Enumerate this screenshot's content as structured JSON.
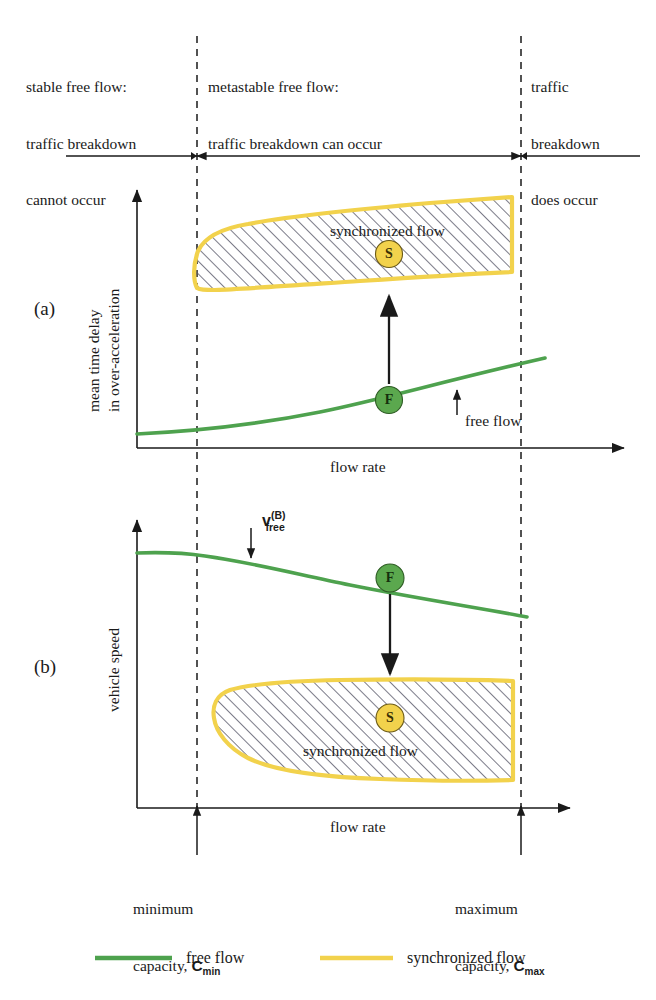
{
  "figure": {
    "colors": {
      "free_flow_green": "#4EA24E",
      "synchronized_yellow": "#F2D24C",
      "axis_black": "#1a1a1a",
      "hatch_gray": "#5a5a6a",
      "background": "#ffffff"
    }
  },
  "regimes": [
    {
      "id": "stable",
      "lines": [
        "stable free flow:",
        "traffic breakdown",
        "cannot occur"
      ]
    },
    {
      "id": "metastable",
      "lines": [
        "metastable free flow:",
        "traffic breakdown can occur"
      ]
    },
    {
      "id": "breakdown",
      "lines": [
        "traffic",
        "breakdown",
        "does occur"
      ]
    }
  ],
  "panels": [
    {
      "id": "a",
      "letter": "(a)",
      "ylabel_lines": [
        "mean time delay",
        "in over-acceleration"
      ],
      "xlabel": "flow rate",
      "free_flow_marker": "F",
      "sync_marker": "S",
      "region_label": "synchronized flow",
      "curve_label": "free flow",
      "arrow_direction": "up"
    },
    {
      "id": "b",
      "letter": "(b)",
      "ylabel_lines": [
        "vehicle speed"
      ],
      "xlabel": "flow rate",
      "free_flow_marker": "F",
      "sync_marker": "S",
      "region_label": "synchronized flow",
      "speed_annotation": {
        "base": "v",
        "sub": "free",
        "sup": "(B)"
      },
      "arrow_direction": "down"
    }
  ],
  "capacities": [
    {
      "id": "min",
      "line1": "minimum",
      "line2_prefix": "capacity, ",
      "symbol_base": "C",
      "symbol_sub": "min"
    },
    {
      "id": "max",
      "line1": "maximum",
      "line2_prefix": "capacity, ",
      "symbol_base": "C",
      "symbol_sub": "max"
    }
  ],
  "legend": {
    "items": [
      {
        "id": "free-flow",
        "label": "free flow",
        "color": "#4EA24E"
      },
      {
        "id": "synchronized-flow",
        "label": "synchronized flow",
        "color": "#F2D24C"
      }
    ]
  },
  "chart_data": {
    "type": "line",
    "xlabel": "flow rate",
    "grid": false,
    "legend_position": "bottom",
    "vertical_markers": [
      {
        "label": "minimum capacity, Cmin",
        "x_px": 197
      },
      {
        "label": "maximum capacity, Cmax",
        "x_px": 521
      }
    ],
    "panels": [
      {
        "id": "a",
        "ylabel": "mean time delay in over-acceleration",
        "series": [
          {
            "name": "free flow",
            "type": "line",
            "color": "#4EA24E",
            "points_px": [
              [
                137,
                434
              ],
              [
                200,
                429
              ],
              [
                260,
                422
              ],
              [
                320,
                411
              ],
              [
                380,
                396
              ],
              [
                440,
                381
              ],
              [
                500,
                368
              ],
              [
                545,
                359
              ]
            ]
          },
          {
            "name": "synchronized flow",
            "type": "region",
            "color": "#F2D24C",
            "hatched": true,
            "outline_px": [
              [
                198,
                279
              ],
              [
                203,
                254
              ],
              [
                218,
                237
              ],
              [
                245,
                227
              ],
              [
                300,
                219
              ],
              [
                380,
                211
              ],
              [
                450,
                203
              ],
              [
                510,
                198
              ],
              [
                510,
                272
              ],
              [
                440,
                276
              ],
              [
                360,
                281
              ],
              [
                280,
                285
              ],
              [
                230,
                288
              ],
              [
                205,
                288
              ],
              [
                198,
                284
              ]
            ]
          }
        ],
        "annotations": [
          {
            "text": "synchronized flow",
            "x_px": 330,
            "y_px": 232
          },
          {
            "text": "S",
            "x_px": 389,
            "y_px": 254,
            "marker": "circle-yellow"
          },
          {
            "text": "F",
            "x_px": 389,
            "y_px": 400,
            "marker": "circle-green"
          },
          {
            "text": "free flow",
            "x_px": 425,
            "y_px": 425
          },
          {
            "text": "transition-arrow-up",
            "from_px": [
              389,
              382
            ],
            "to_px": [
              389,
              292
            ]
          }
        ]
      },
      {
        "id": "b",
        "ylabel": "vehicle speed",
        "series": [
          {
            "name": "free flow",
            "type": "line",
            "color": "#4EA24E",
            "points_px": [
              [
                137,
                553
              ],
              [
                175,
                553
              ],
              [
                200,
                554
              ],
              [
                240,
                559
              ],
              [
                280,
                566
              ],
              [
                320,
                576
              ],
              [
                360,
                586
              ],
              [
                400,
                594
              ],
              [
                450,
                604
              ],
              [
                500,
                611
              ],
              [
                527,
                616
              ]
            ]
          },
          {
            "name": "synchronized flow",
            "type": "region",
            "color": "#F2D24C",
            "hatched": true,
            "outline_px": [
              [
                222,
                688
              ],
              [
                260,
                683
              ],
              [
                330,
                681
              ],
              [
                410,
                680
              ],
              [
                480,
                680
              ],
              [
                512,
                680
              ],
              [
                512,
                778
              ],
              [
                430,
                780
              ],
              [
                350,
                778
              ],
              [
                280,
                770
              ],
              [
                240,
                752
              ],
              [
                219,
                727
              ],
              [
                215,
                706
              ]
            ]
          }
        ],
        "annotations": [
          {
            "text": "v_free^(B)",
            "x_px": 285,
            "y_px": 530
          },
          {
            "text": "F",
            "x_px": 390,
            "y_px": 578,
            "marker": "circle-green"
          },
          {
            "text": "S",
            "x_px": 390,
            "y_px": 718,
            "marker": "circle-yellow"
          },
          {
            "text": "synchronized flow",
            "x_px": 360,
            "y_px": 752
          },
          {
            "text": "transition-arrow-down",
            "from_px": [
              390,
              596
            ],
            "to_px": [
              390,
              680
            ]
          }
        ]
      }
    ]
  }
}
